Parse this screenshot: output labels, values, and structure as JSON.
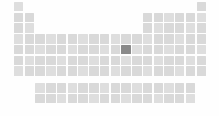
{
  "view": {
    "title": "Periodic Table",
    "kind": "periodic-table-minimap",
    "width": 219,
    "height": 116,
    "background_color": "#fefefe"
  },
  "palette": {
    "cell_color": "#d9d9d9",
    "cell_color_alt": "#dedede",
    "selected_color": "#8a8a8a",
    "background_color": "#fefefe"
  },
  "geometry": {
    "origin_x": 14,
    "origin_y": 2,
    "col_pitch": 10.74,
    "row_pitch": 10.74,
    "cell_size": 9.4,
    "block_gap_y": 6,
    "block_offset_cols": 2
  },
  "selection": {
    "symbol": "Ag",
    "name": "Silver",
    "atomic_number": 47,
    "group": 11,
    "period": 5,
    "col_index": 10,
    "row_index": 4
  },
  "legend": {
    "selected_label": "Selected element",
    "cell_label": "Element"
  },
  "layout": {
    "main_rows": [
      {
        "period": 1,
        "cols": [
          0,
          17
        ]
      },
      {
        "period": 2,
        "cols": [
          0,
          1,
          12,
          13,
          14,
          15,
          16,
          17
        ]
      },
      {
        "period": 3,
        "cols": [
          0,
          1,
          12,
          13,
          14,
          15,
          16,
          17
        ]
      },
      {
        "period": 4,
        "cols": [
          0,
          1,
          2,
          3,
          4,
          5,
          6,
          7,
          8,
          9,
          10,
          11,
          12,
          13,
          14,
          15,
          16,
          17
        ]
      },
      {
        "period": 5,
        "cols": [
          0,
          1,
          2,
          3,
          4,
          5,
          6,
          7,
          8,
          9,
          10,
          11,
          12,
          13,
          14,
          15,
          16,
          17
        ]
      },
      {
        "period": 6,
        "cols": [
          0,
          1,
          2,
          3,
          4,
          5,
          6,
          7,
          8,
          9,
          10,
          11,
          12,
          13,
          14,
          15,
          16,
          17
        ]
      },
      {
        "period": 7,
        "cols": [
          0,
          1,
          2,
          3,
          4,
          5,
          6,
          7,
          8,
          9,
          10,
          11,
          12,
          13,
          14,
          15,
          16,
          17
        ]
      }
    ],
    "fblock_rows": [
      {
        "series": "lanthanides",
        "count": 15,
        "start_col": 2
      },
      {
        "series": "actinides",
        "count": 15,
        "start_col": 2
      }
    ]
  },
  "elements": {
    "period_1": [
      "H",
      "He"
    ],
    "period_2": [
      "Li",
      "Be",
      "B",
      "C",
      "N",
      "O",
      "F",
      "Ne"
    ],
    "period_3": [
      "Na",
      "Mg",
      "Al",
      "Si",
      "P",
      "S",
      "Cl",
      "Ar"
    ],
    "period_4": [
      "K",
      "Ca",
      "Sc",
      "Ti",
      "V",
      "Cr",
      "Mn",
      "Fe",
      "Co",
      "Ni",
      "Cu",
      "Zn",
      "Ga",
      "Ge",
      "As",
      "Se",
      "Br",
      "Kr"
    ],
    "period_5": [
      "Rb",
      "Sr",
      "Y",
      "Zr",
      "Nb",
      "Mo",
      "Tc",
      "Ru",
      "Rh",
      "Pd",
      "Ag",
      "Cd",
      "In",
      "Sn",
      "Sb",
      "Te",
      "I",
      "Xe"
    ],
    "period_6": [
      "Cs",
      "Ba",
      "La",
      "Hf",
      "Ta",
      "W",
      "Re",
      "Os",
      "Ir",
      "Pt",
      "Au",
      "Hg",
      "Tl",
      "Pb",
      "Bi",
      "Po",
      "At",
      "Rn"
    ],
    "period_7": [
      "Fr",
      "Ra",
      "Ac",
      "Rf",
      "Db",
      "Sg",
      "Bh",
      "Hs",
      "Mt",
      "Ds",
      "Rg",
      "Cn",
      "Nh",
      "Fl",
      "Mc",
      "Lv",
      "Ts",
      "Og"
    ],
    "lanthanides": [
      "Ce",
      "Pr",
      "Nd",
      "Pm",
      "Sm",
      "Eu",
      "Gd",
      "Tb",
      "Dy",
      "Ho",
      "Er",
      "Tm",
      "Yb",
      "Lu",
      "Lr"
    ],
    "actinides": [
      "Th",
      "Pa",
      "U",
      "Np",
      "Pu",
      "Am",
      "Cm",
      "Bk",
      "Cf",
      "Es",
      "Fm",
      "Md",
      "No",
      "Lr",
      "Db"
    ]
  }
}
